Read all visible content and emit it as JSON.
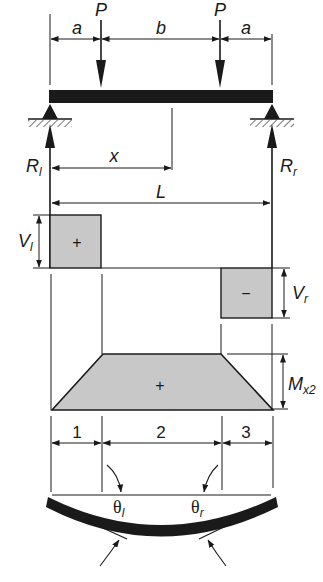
{
  "loads": {
    "left_load_label": "P",
    "right_load_label": "P"
  },
  "dimensions": {
    "a_left": "a",
    "b": "b",
    "a_right": "a",
    "x": "x",
    "L": "L"
  },
  "reactions": {
    "left_main": "R",
    "left_sub": "l",
    "right_main": "R",
    "right_sub": "r"
  },
  "shear_diagram": {
    "left_main": "V",
    "left_sub": "l",
    "left_sign": "+",
    "right_main": "V",
    "right_sub": "r",
    "right_sign": "−"
  },
  "moment_diagram": {
    "label_main": "M",
    "label_sub": "x2",
    "sign": "+"
  },
  "segments": [
    "1",
    "2",
    "3"
  ],
  "deflection": {
    "left_angle_main": "θ",
    "left_angle_sub": "l",
    "right_angle_main": "θ",
    "right_angle_sub": "r"
  },
  "colors": {
    "ink": "#1a1a1a",
    "fill_gray": "#c8c8c8",
    "background": "#ffffff"
  }
}
